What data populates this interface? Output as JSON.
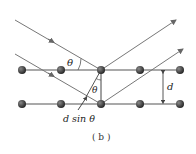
{
  "figure": {
    "caption": "( b )",
    "labels": {
      "theta_incident": "θ",
      "theta_inner": "θ",
      "spacing": "d",
      "path_difference": "d sin θ"
    },
    "atom_rows": 2,
    "atoms_per_row": 5,
    "colors": {
      "line": "#555555",
      "ray": "#777777",
      "atom": "#333333"
    }
  }
}
